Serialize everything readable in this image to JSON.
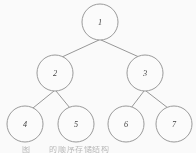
{
  "figure": {
    "kind": "binary-tree-diagram",
    "background_color": "#ffffff",
    "stroke_color": "#8a8a8a",
    "label_color": "#3b3b3b",
    "caption_color": "#b9b9b9",
    "caption_label": "图",
    "caption_number": "",
    "caption_text": "的顺序存储结构",
    "node_radius": 18
  },
  "nodes": [
    {
      "id": "n1",
      "label": "1",
      "cx": 100,
      "cy": 22,
      "r": 18,
      "level": 0
    },
    {
      "id": "n2",
      "label": "2",
      "cx": 55,
      "cy": 73,
      "r": 18,
      "level": 1
    },
    {
      "id": "n3",
      "label": "3",
      "cx": 145,
      "cy": 73,
      "r": 18,
      "level": 1
    },
    {
      "id": "n4",
      "label": "4",
      "cx": 25,
      "cy": 124,
      "r": 18,
      "level": 2
    },
    {
      "id": "n5",
      "label": "5",
      "cx": 76,
      "cy": 124,
      "r": 18,
      "level": 2
    },
    {
      "id": "n6",
      "label": "6",
      "cx": 126,
      "cy": 124,
      "r": 18,
      "level": 2
    },
    {
      "id": "n7",
      "label": "7",
      "cx": 174,
      "cy": 124,
      "r": 18,
      "level": 2
    }
  ],
  "edges": [
    {
      "id": "e1",
      "from": "n1",
      "to": "n2",
      "x1": 99,
      "y1": 40,
      "x2": 62,
      "y2": 57
    },
    {
      "id": "e2",
      "from": "n1",
      "to": "n3",
      "x1": 101,
      "y1": 40,
      "x2": 139,
      "y2": 57
    },
    {
      "id": "e3",
      "from": "n2",
      "to": "n4",
      "x1": 54,
      "y1": 91,
      "x2": 33,
      "y2": 108
    },
    {
      "id": "e4",
      "from": "n2",
      "to": "n5",
      "x1": 56,
      "y1": 91,
      "x2": 70,
      "y2": 108
    },
    {
      "id": "e5",
      "from": "n3",
      "to": "n6",
      "x1": 144,
      "y1": 91,
      "x2": 131,
      "y2": 108
    },
    {
      "id": "e6",
      "from": "n3",
      "to": "n7",
      "x1": 146,
      "y1": 91,
      "x2": 168,
      "y2": 108
    }
  ]
}
